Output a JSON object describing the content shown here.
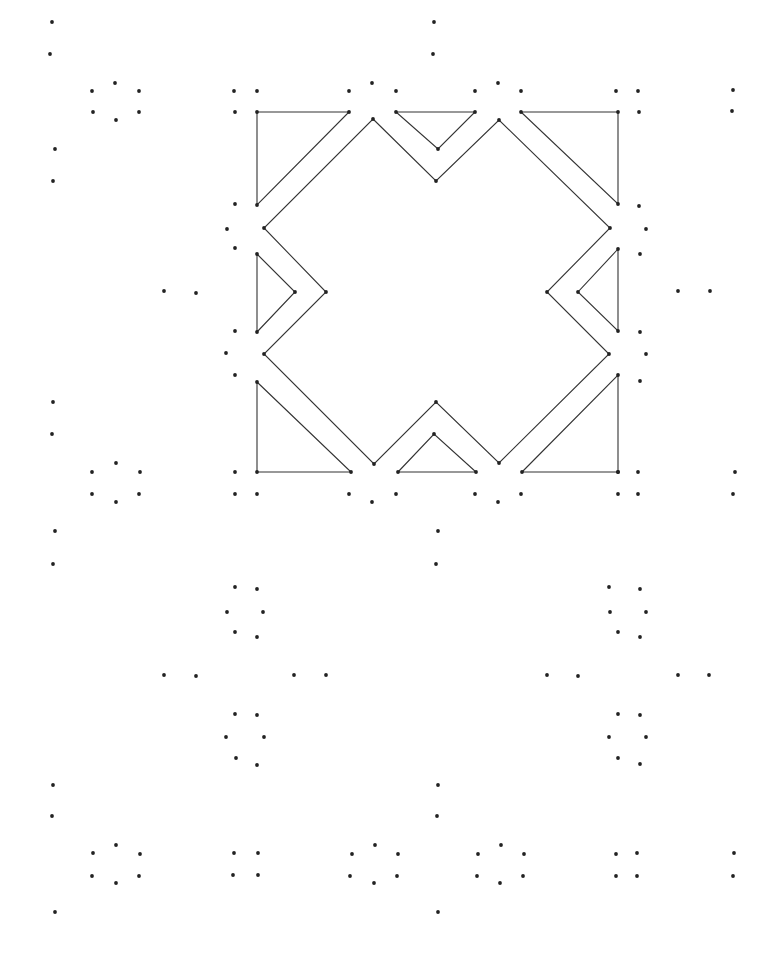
{
  "diagram": {
    "type": "dot-grid geometric pattern",
    "background": "#ffffff",
    "line_color": "#333333",
    "dot_color": "#222222",
    "dot_radius": 1.9,
    "shapes": [
      {
        "name": "triangle-top-left",
        "points": [
          [
            257,
            112
          ],
          [
            349,
            112
          ],
          [
            257,
            205
          ]
        ]
      },
      {
        "name": "triangle-top-middle",
        "points": [
          [
            396,
            112
          ],
          [
            475,
            112
          ],
          [
            438,
            149
          ]
        ]
      },
      {
        "name": "triangle-top-right",
        "points": [
          [
            521,
            112
          ],
          [
            618,
            112
          ],
          [
            618,
            204
          ]
        ]
      },
      {
        "name": "cross-outline",
        "points": [
          [
            373,
            119
          ],
          [
            436,
            181
          ],
          [
            499,
            120
          ],
          [
            610,
            228
          ],
          [
            547,
            292
          ],
          [
            609,
            354
          ],
          [
            499,
            463
          ],
          [
            436,
            402
          ],
          [
            374,
            464
          ],
          [
            264,
            354
          ],
          [
            326,
            292
          ],
          [
            264,
            228
          ]
        ]
      },
      {
        "name": "triangle-left",
        "points": [
          [
            257,
            254
          ],
          [
            295,
            292
          ],
          [
            257,
            332
          ]
        ]
      },
      {
        "name": "triangle-right",
        "points": [
          [
            618,
            249
          ],
          [
            578,
            292
          ],
          [
            618,
            331
          ]
        ]
      },
      {
        "name": "triangle-bottom-left",
        "points": [
          [
            257,
            382
          ],
          [
            351,
            472
          ],
          [
            257,
            472
          ]
        ]
      },
      {
        "name": "triangle-bottom-middle",
        "points": [
          [
            398,
            472
          ],
          [
            434,
            434
          ],
          [
            476,
            472
          ]
        ]
      },
      {
        "name": "triangle-bottom-right",
        "points": [
          [
            522,
            472
          ],
          [
            618,
            375
          ],
          [
            618,
            472
          ]
        ]
      }
    ],
    "dots": [
      [
        52,
        22
      ],
      [
        50,
        54
      ],
      [
        434,
        22
      ],
      [
        433,
        54
      ],
      [
        92,
        91
      ],
      [
        115,
        83
      ],
      [
        139,
        91
      ],
      [
        93,
        112
      ],
      [
        116,
        120
      ],
      [
        139,
        112
      ],
      [
        234,
        91
      ],
      [
        257,
        91
      ],
      [
        349,
        91
      ],
      [
        372,
        83
      ],
      [
        396,
        91
      ],
      [
        475,
        91
      ],
      [
        498,
        83
      ],
      [
        521,
        91
      ],
      [
        616,
        91
      ],
      [
        638,
        91
      ],
      [
        733,
        90
      ],
      [
        732,
        111
      ],
      [
        235,
        112
      ],
      [
        639,
        112
      ],
      [
        55,
        149
      ],
      [
        53,
        181
      ],
      [
        235,
        204
      ],
      [
        639,
        206
      ],
      [
        227,
        229
      ],
      [
        646,
        229
      ],
      [
        235,
        248
      ],
      [
        640,
        254
      ],
      [
        164,
        291
      ],
      [
        196,
        293
      ],
      [
        678,
        291
      ],
      [
        710,
        291
      ],
      [
        235,
        331
      ],
      [
        640,
        332
      ],
      [
        226,
        353
      ],
      [
        646,
        354
      ],
      [
        235,
        375
      ],
      [
        640,
        381
      ],
      [
        53,
        402
      ],
      [
        52,
        434
      ],
      [
        92,
        472
      ],
      [
        116,
        463
      ],
      [
        140,
        472
      ],
      [
        92,
        494
      ],
      [
        116,
        502
      ],
      [
        139,
        494
      ],
      [
        235,
        472
      ],
      [
        235,
        494
      ],
      [
        257,
        494
      ],
      [
        349,
        494
      ],
      [
        372,
        502
      ],
      [
        396,
        494
      ],
      [
        475,
        494
      ],
      [
        498,
        502
      ],
      [
        521,
        494
      ],
      [
        618,
        472
      ],
      [
        638,
        472
      ],
      [
        618,
        494
      ],
      [
        638,
        494
      ],
      [
        735,
        472
      ],
      [
        733,
        494
      ],
      [
        55,
        531
      ],
      [
        53,
        564
      ],
      [
        438,
        531
      ],
      [
        436,
        564
      ],
      [
        235,
        587
      ],
      [
        257,
        589
      ],
      [
        227,
        612
      ],
      [
        263,
        612
      ],
      [
        235,
        632
      ],
      [
        257,
        637
      ],
      [
        609,
        587
      ],
      [
        640,
        589
      ],
      [
        610,
        612
      ],
      [
        646,
        612
      ],
      [
        618,
        632
      ],
      [
        640,
        637
      ],
      [
        164,
        675
      ],
      [
        196,
        676
      ],
      [
        294,
        675
      ],
      [
        326,
        675
      ],
      [
        547,
        675
      ],
      [
        578,
        676
      ],
      [
        678,
        675
      ],
      [
        709,
        675
      ],
      [
        235,
        714
      ],
      [
        257,
        715
      ],
      [
        226,
        737
      ],
      [
        264,
        737
      ],
      [
        236,
        758
      ],
      [
        257,
        765
      ],
      [
        618,
        714
      ],
      [
        640,
        715
      ],
      [
        609,
        737
      ],
      [
        646,
        737
      ],
      [
        618,
        758
      ],
      [
        640,
        764
      ],
      [
        53,
        785
      ],
      [
        52,
        816
      ],
      [
        438,
        785
      ],
      [
        437,
        816
      ],
      [
        93,
        853
      ],
      [
        116,
        845
      ],
      [
        140,
        854
      ],
      [
        92,
        876
      ],
      [
        116,
        883
      ],
      [
        139,
        876
      ],
      [
        234,
        853
      ],
      [
        258,
        853
      ],
      [
        233,
        875
      ],
      [
        258,
        875
      ],
      [
        352,
        854
      ],
      [
        375,
        845
      ],
      [
        398,
        854
      ],
      [
        350,
        876
      ],
      [
        374,
        883
      ],
      [
        397,
        876
      ],
      [
        478,
        854
      ],
      [
        501,
        845
      ],
      [
        524,
        854
      ],
      [
        477,
        876
      ],
      [
        500,
        883
      ],
      [
        523,
        876
      ],
      [
        616,
        854
      ],
      [
        637,
        853
      ],
      [
        616,
        876
      ],
      [
        637,
        876
      ],
      [
        734,
        853
      ],
      [
        733,
        876
      ],
      [
        55,
        912
      ],
      [
        438,
        912
      ]
    ]
  }
}
